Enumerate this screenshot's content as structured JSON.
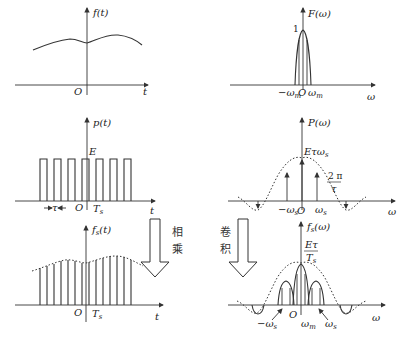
{
  "panels": {
    "ft": {
      "ylabel": "f(t)",
      "xlabel": "t",
      "origin": "O"
    },
    "Fw": {
      "ylabel": "F(ω)",
      "xlabel": "ω",
      "origin": "O",
      "peak": "1",
      "neg_wm": "−ω",
      "neg_wm_sub": "m",
      "pos_wm": "ω",
      "pos_wm_sub": "m"
    },
    "pt": {
      "ylabel": "p(t)",
      "xlabel": "t",
      "origin": "O",
      "amplitude": "E",
      "width": "τ",
      "period": "T",
      "period_sub": "s"
    },
    "Pw": {
      "ylabel": "P(ω)",
      "xlabel": "ω",
      "origin": "O",
      "peak": "Eτω",
      "peak_sub": "s",
      "zero_num": "2 π",
      "zero_den": "τ",
      "neg_ws": "−ω",
      "neg_ws_sub": "s",
      "pos_ws": "ω",
      "pos_ws_sub": "s"
    },
    "fst": {
      "ylabel": "f",
      "ylabel_sub": "s",
      "ylabel_tail": "(t)",
      "xlabel": "t",
      "origin": "O",
      "period": "T",
      "period_sub": "s"
    },
    "Fsw": {
      "ylabel": "f",
      "ylabel_sub": "s",
      "ylabel_tail": "(ω)",
      "xlabel": "ω",
      "origin": "O",
      "peak_num": "Eτ",
      "peak_den": "T",
      "peak_den_sub": "s",
      "neg_ws": "−ω",
      "neg_ws_sub": "s",
      "wm": "ω",
      "wm_sub": "m",
      "pos_ws": "ω",
      "pos_ws_sub": "s"
    }
  },
  "arrows": {
    "multiply": {
      "char1": "相",
      "char2": "乘"
    },
    "convolve": {
      "char1": "卷",
      "char2": "积"
    }
  }
}
